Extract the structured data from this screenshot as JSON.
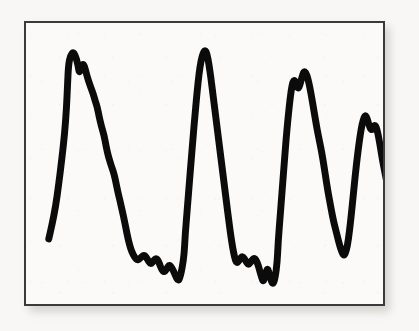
{
  "figure": {
    "kind": "scanned-waveform-plate",
    "frame": {
      "x": 24,
      "y": 21,
      "width": 361,
      "height": 285,
      "border_color": "#3a3a3c",
      "border_width": 2,
      "plate_color": "#fbfaf9"
    },
    "page_background": "#f8f7f5",
    "shadow_color": "#b9b6b2"
  },
  "chart_data": {
    "type": "line",
    "title": "",
    "subtitle": "",
    "xlabel": "",
    "ylabel": "",
    "xlim": [
      0,
      361
    ],
    "ylim": [
      0,
      285
    ],
    "grid": false,
    "legend": null,
    "axis_ticks": {
      "x": [],
      "y": []
    },
    "annotations": [],
    "series": [
      {
        "name": "trace",
        "color": "#0b0b0b",
        "line_width": 7,
        "description": "Thick hand-drawn periodic waveform with four tall peaks separated by noisy low valleys, drawn in plot-local coordinates where x increases rightward and y increases downward.",
        "points": [
          [
            23,
            219
          ],
          [
            26,
            206
          ],
          [
            30,
            186
          ],
          [
            33,
            164
          ],
          [
            36,
            140
          ],
          [
            39,
            113
          ],
          [
            41,
            86
          ],
          [
            42,
            62
          ],
          [
            43,
            42
          ],
          [
            45,
            33
          ],
          [
            48,
            29
          ],
          [
            51,
            36
          ],
          [
            53,
            45
          ],
          [
            54,
            51
          ],
          [
            56,
            44
          ],
          [
            58,
            41
          ],
          [
            60,
            47
          ],
          [
            62,
            55
          ],
          [
            65,
            64
          ],
          [
            68,
            72
          ],
          [
            70,
            79
          ],
          [
            72,
            85
          ],
          [
            74,
            95
          ],
          [
            76,
            104
          ],
          [
            79,
            114
          ],
          [
            81,
            125
          ],
          [
            83,
            134
          ],
          [
            85,
            141
          ],
          [
            87,
            147
          ],
          [
            89,
            153
          ],
          [
            91,
            162
          ],
          [
            93,
            172
          ],
          [
            95,
            180
          ],
          [
            97,
            189
          ],
          [
            99,
            198
          ],
          [
            101,
            208
          ],
          [
            103,
            218
          ],
          [
            105,
            226
          ],
          [
            107,
            232
          ],
          [
            110,
            238
          ],
          [
            113,
            241
          ],
          [
            117,
            237
          ],
          [
            120,
            235
          ],
          [
            123,
            240
          ],
          [
            126,
            245
          ],
          [
            129,
            241
          ],
          [
            132,
            238
          ],
          [
            135,
            244
          ],
          [
            137,
            250
          ],
          [
            140,
            253
          ],
          [
            143,
            248
          ],
          [
            145,
            245
          ],
          [
            148,
            249
          ],
          [
            151,
            256
          ],
          [
            154,
            262
          ],
          [
            156,
            257
          ],
          [
            158,
            248
          ],
          [
            160,
            234
          ],
          [
            161,
            214
          ],
          [
            163,
            190
          ],
          [
            165,
            164
          ],
          [
            167,
            140
          ],
          [
            169,
            115
          ],
          [
            171,
            92
          ],
          [
            173,
            70
          ],
          [
            175,
            51
          ],
          [
            177,
            38
          ],
          [
            179,
            31
          ],
          [
            181,
            27
          ],
          [
            183,
            31
          ],
          [
            185,
            42
          ],
          [
            187,
            56
          ],
          [
            189,
            72
          ],
          [
            191,
            88
          ],
          [
            193,
            104
          ],
          [
            195,
            120
          ],
          [
            197,
            136
          ],
          [
            199,
            152
          ],
          [
            201,
            168
          ],
          [
            203,
            184
          ],
          [
            205,
            200
          ],
          [
            207,
            215
          ],
          [
            209,
            228
          ],
          [
            211,
            238
          ],
          [
            213,
            244
          ],
          [
            216,
            240
          ],
          [
            219,
            236
          ],
          [
            222,
            241
          ],
          [
            225,
            246
          ],
          [
            228,
            241
          ],
          [
            231,
            238
          ],
          [
            234,
            243
          ],
          [
            236,
            250
          ],
          [
            238,
            257
          ],
          [
            240,
            263
          ],
          [
            242,
            256
          ],
          [
            244,
            248
          ],
          [
            246,
            254
          ],
          [
            248,
            262
          ],
          [
            250,
            265
          ],
          [
            252,
            258
          ],
          [
            254,
            243
          ],
          [
            255,
            222
          ],
          [
            257,
            196
          ],
          [
            259,
            170
          ],
          [
            261,
            144
          ],
          [
            263,
            118
          ],
          [
            265,
            96
          ],
          [
            267,
            77
          ],
          [
            269,
            63
          ],
          [
            271,
            57
          ],
          [
            273,
            62
          ],
          [
            275,
            67
          ],
          [
            277,
            63
          ],
          [
            279,
            55
          ],
          [
            281,
            49
          ],
          [
            283,
            50
          ],
          [
            285,
            56
          ],
          [
            287,
            65
          ],
          [
            289,
            76
          ],
          [
            291,
            88
          ],
          [
            293,
            100
          ],
          [
            295,
            111
          ],
          [
            297,
            121
          ],
          [
            299,
            131
          ],
          [
            301,
            143
          ],
          [
            303,
            156
          ],
          [
            305,
            169
          ],
          [
            307,
            180
          ],
          [
            309,
            191
          ],
          [
            311,
            201
          ],
          [
            313,
            209
          ],
          [
            315,
            217
          ],
          [
            317,
            225
          ],
          [
            319,
            231
          ],
          [
            321,
            236
          ],
          [
            323,
            234
          ],
          [
            325,
            226
          ],
          [
            327,
            212
          ],
          [
            329,
            194
          ],
          [
            331,
            174
          ],
          [
            333,
            154
          ],
          [
            335,
            136
          ],
          [
            337,
            120
          ],
          [
            339,
            107
          ],
          [
            341,
            98
          ],
          [
            343,
            93
          ],
          [
            345,
            97
          ],
          [
            347,
            104
          ],
          [
            349,
            109
          ],
          [
            351,
            106
          ],
          [
            353,
            103
          ],
          [
            355,
            108
          ],
          [
            357,
            118
          ],
          [
            359,
            130
          ],
          [
            361,
            142
          ],
          [
            363,
            152
          ],
          [
            365,
            162
          ],
          [
            367,
            172
          ],
          [
            369,
            180
          ],
          [
            371,
            184
          ],
          [
            373,
            180
          ],
          [
            375,
            172
          ],
          [
            377,
            166
          ]
        ]
      }
    ]
  }
}
